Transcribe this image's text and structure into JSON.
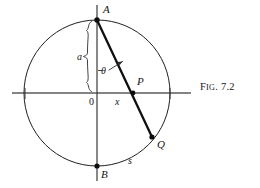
{
  "figure": {
    "caption_prefix": "F",
    "caption_smallcaps": "IG",
    "caption_number": ". 7.2",
    "caption_full": "Fig. 7.2",
    "background_color": "#ffffff",
    "ink_color": "#141414",
    "axis_color": "#555555",
    "circle_color": "#222222"
  },
  "points": [
    {
      "id": "A",
      "label": "A",
      "x": 97,
      "y": 20,
      "label_x": 103,
      "label_y": 13,
      "dot": true
    },
    {
      "id": "P",
      "label": "P",
      "x": 133,
      "y": 93,
      "label_x": 137,
      "label_y": 84,
      "dot": true
    },
    {
      "id": "Q",
      "label": "Q",
      "x": 152,
      "y": 137,
      "label_x": 157,
      "label_y": 148,
      "dot": true
    },
    {
      "id": "B",
      "label": "B",
      "x": 97,
      "y": 166,
      "label_x": 101,
      "label_y": 177,
      "dot": true
    },
    {
      "id": "O",
      "label": "0",
      "x": 97,
      "y": 93,
      "label_x": 89,
      "label_y": 104,
      "dot": false
    }
  ],
  "variables": [
    {
      "id": "a",
      "label": "a",
      "x": 80,
      "y": 60,
      "meaning": "radius-brace-label"
    },
    {
      "id": "theta",
      "label": "θ",
      "x": 104,
      "y": 71,
      "meaning": "angle-label"
    },
    {
      "id": "x",
      "label": "x",
      "x": 118,
      "y": 104,
      "meaning": "horizontal-distance-label"
    },
    {
      "id": "s",
      "label": "s",
      "x": 131,
      "y": 163,
      "meaning": "arc-length-label"
    }
  ],
  "geometry": {
    "circle": {
      "cx": 97,
      "cy": 93,
      "r": 73
    },
    "horizontal_axis": {
      "x1": 12,
      "y1": 93,
      "x2": 191,
      "y2": 93
    },
    "vertical_axis": {
      "x1": 97,
      "y1": 5,
      "x2": 97,
      "y2": 181
    },
    "chord": {
      "x1": 97,
      "y1": 20,
      "x2": 152,
      "y2": 137
    },
    "brace": {
      "top_y": 20,
      "bottom_y": 93,
      "x": 90
    },
    "angle_arrow": {
      "from_x": 110,
      "from_y": 70,
      "to_x": 122,
      "to_y": 62
    }
  }
}
